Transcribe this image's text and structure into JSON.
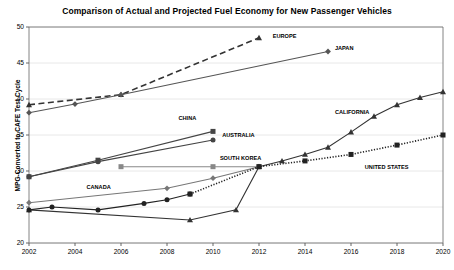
{
  "chart_data": {
    "type": "line",
    "title": "Comparison of Actual and Projected Fuel Economy for New Passenger Vehicles",
    "xlabel": "",
    "ylabel": "MPG-Converted to CAFE Test Cycle",
    "xlim": [
      2002,
      2020
    ],
    "ylim": [
      20,
      50
    ],
    "xticks": [
      "2002",
      "2004",
      "2006",
      "2008",
      "2010",
      "2012",
      "2014",
      "2016",
      "2018",
      "2020"
    ],
    "yticks": [
      "20",
      "25",
      "30",
      "35",
      "40",
      "45",
      "50"
    ],
    "grid": "horizontal-light",
    "legend": "inline-labels",
    "series": [
      {
        "name": "EUROPE",
        "label": "EUROPE",
        "marker": "triangle",
        "line": "dashed",
        "color": "#333333",
        "label_x": 2012.6,
        "label_y": 48.6,
        "points": [
          {
            "x": 2002,
            "y": 39.2
          },
          {
            "x": 2006,
            "y": 40.6
          },
          {
            "x": 2012,
            "y": 48.5
          }
        ]
      },
      {
        "name": "JAPAN",
        "label": "JAPAN",
        "marker": "diamond",
        "line": "solid",
        "color": "#555555",
        "label_x": 2015.3,
        "label_y": 47.0,
        "points": [
          {
            "x": 2002,
            "y": 38.1
          },
          {
            "x": 2004,
            "y": 39.3
          },
          {
            "x": 2006,
            "y": 40.6
          },
          {
            "x": 2015,
            "y": 46.6
          }
        ]
      },
      {
        "name": "CHINA",
        "label": "CHINA",
        "marker": "square",
        "line": "solid",
        "color": "#444444",
        "label_x": 2008.5,
        "label_y": 37.2,
        "points": [
          {
            "x": 2002,
            "y": 29.2
          },
          {
            "x": 2005,
            "y": 31.5
          },
          {
            "x": 2010,
            "y": 35.5
          }
        ]
      },
      {
        "name": "AUSTRALIA",
        "label": "AUSTRALIA",
        "marker": "circle",
        "line": "solid",
        "color": "#444444",
        "label_x": 2010.4,
        "label_y": 34.8,
        "points": [
          {
            "x": 2002,
            "y": 29.2
          },
          {
            "x": 2005,
            "y": 31.3
          },
          {
            "x": 2010,
            "y": 34.3
          }
        ]
      },
      {
        "name": "SOUTH KOREA",
        "label": "SOUTH KOREA",
        "marker": "square",
        "line": "solid",
        "color": "#888888",
        "label_x": 2010.3,
        "label_y": 31.6,
        "points": [
          {
            "x": 2006,
            "y": 30.6
          },
          {
            "x": 2010,
            "y": 30.6
          },
          {
            "x": 2012,
            "y": 30.6
          }
        ]
      },
      {
        "name": "CANADA",
        "label": "CANADA",
        "marker": "diamond",
        "line": "solid",
        "color": "#777777",
        "label_x": 2004.5,
        "label_y": 27.6,
        "points": [
          {
            "x": 2002,
            "y": 25.6
          },
          {
            "x": 2008,
            "y": 27.6
          },
          {
            "x": 2010,
            "y": 29.0
          },
          {
            "x": 2012,
            "y": 30.6
          }
        ]
      },
      {
        "name": "CALIFORNIA",
        "label": "CALIFORNIA",
        "marker": "triangle",
        "line": "solid",
        "color": "#333333",
        "label_x": 2015.3,
        "label_y": 38.0,
        "points": [
          {
            "x": 2002,
            "y": 24.6
          },
          {
            "x": 2009,
            "y": 23.2
          },
          {
            "x": 2011,
            "y": 24.6
          },
          {
            "x": 2012,
            "y": 30.6
          },
          {
            "x": 2013,
            "y": 31.4
          },
          {
            "x": 2014,
            "y": 32.3
          },
          {
            "x": 2015,
            "y": 33.3
          },
          {
            "x": 2016,
            "y": 35.4
          },
          {
            "x": 2017,
            "y": 37.6
          },
          {
            "x": 2018,
            "y": 39.2
          },
          {
            "x": 2019,
            "y": 40.2
          },
          {
            "x": 2020,
            "y": 41.0
          }
        ]
      },
      {
        "name": "UNITED STATES",
        "label": "UNITED STATES",
        "marker": "circle",
        "line": "solid",
        "color": "#222222",
        "label_x": 2016.6,
        "label_y": 30.4,
        "points": [
          {
            "x": 2002,
            "y": 24.6
          },
          {
            "x": 2003,
            "y": 25.0
          },
          {
            "x": 2005,
            "y": 24.6
          },
          {
            "x": 2007,
            "y": 25.5
          },
          {
            "x": 2008,
            "y": 26.0
          },
          {
            "x": 2009,
            "y": 26.8
          }
        ]
      },
      {
        "name": "UNITED STATES PROJECTED",
        "label": "",
        "marker": "square",
        "line": "dotted",
        "color": "#222222",
        "label_x": null,
        "label_y": null,
        "points": [
          {
            "x": 2009,
            "y": 26.8
          },
          {
            "x": 2012,
            "y": 30.6
          },
          {
            "x": 2014,
            "y": 31.4
          },
          {
            "x": 2016,
            "y": 32.3
          },
          {
            "x": 2018,
            "y": 33.6
          },
          {
            "x": 2020,
            "y": 35.0
          }
        ]
      }
    ]
  }
}
